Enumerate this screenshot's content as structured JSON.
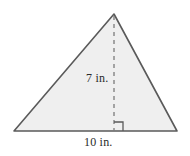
{
  "figure": {
    "name": "triangle-with-height",
    "shape": "triangle",
    "background_color": "#ffffff",
    "fill_color": "#efefef",
    "stroke_color": "#5a5a5a",
    "dashed_stroke_color": "#7a7a7a",
    "text_color": "#2b2b2b",
    "labels": {
      "height": "7 in.",
      "base": "10 in."
    },
    "geometry": {
      "apex": [
        114,
        14
      ],
      "bottom_left": [
        14,
        131
      ],
      "bottom_right": [
        177,
        131
      ],
      "height_foot": [
        114,
        131
      ],
      "right_angle_marker": {
        "x": 114,
        "y": 122,
        "size": 9
      }
    },
    "measurements": {
      "height_value": 7,
      "base_value": 10,
      "unit": "in."
    }
  }
}
